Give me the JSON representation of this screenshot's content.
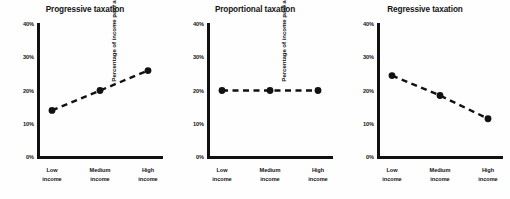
{
  "figure": {
    "background": "#fefefe",
    "ink": "#111111",
    "panel_count": 3
  },
  "chart_data": [
    {
      "type": "line",
      "title": "Progressive taxation",
      "xlabel": "",
      "ylabel": "Percentage of income paid as taxation",
      "categories": [
        "Low income",
        "Medium income",
        "High income"
      ],
      "category_lines": [
        [
          "Low",
          "income"
        ],
        [
          "Medium",
          "income"
        ],
        [
          "High",
          "income"
        ]
      ],
      "values": [
        14,
        20,
        26
      ],
      "ylim": [
        0,
        40
      ],
      "yticks": [
        0,
        10,
        20,
        30,
        40
      ],
      "ytick_labels": [
        "0%",
        "10%",
        "20%",
        "30%",
        "40%"
      ],
      "grid": false,
      "legend": "none",
      "line_style": "dashed",
      "marker": "circle",
      "series_color": "#111111"
    },
    {
      "type": "line",
      "title": "Proportional taxation",
      "xlabel": "",
      "ylabel": "Percentage of income paid as taxation",
      "categories": [
        "Low income",
        "Medium income",
        "High income"
      ],
      "category_lines": [
        [
          "Low",
          "income"
        ],
        [
          "Medium",
          "income"
        ],
        [
          "High",
          "income"
        ]
      ],
      "values": [
        20,
        20,
        20
      ],
      "ylim": [
        0,
        40
      ],
      "yticks": [
        0,
        10,
        20,
        30,
        40
      ],
      "ytick_labels": [
        "0%",
        "10%",
        "20%",
        "30%",
        "40%"
      ],
      "grid": false,
      "legend": "none",
      "line_style": "dashed",
      "marker": "circle",
      "series_color": "#111111"
    },
    {
      "type": "line",
      "title": "Regressive taxation",
      "xlabel": "",
      "ylabel": "Percentage of income paid as taxation",
      "categories": [
        "Low income",
        "Medium income",
        "High income"
      ],
      "category_lines": [
        [
          "Low",
          "income"
        ],
        [
          "Medium",
          "income"
        ],
        [
          "High",
          "income"
        ]
      ],
      "values": [
        24.5,
        18.5,
        11.5
      ],
      "ylim": [
        0,
        40
      ],
      "yticks": [
        0,
        10,
        20,
        30,
        40
      ],
      "ytick_labels": [
        "0%",
        "10%",
        "20%",
        "30%",
        "40%"
      ],
      "grid": false,
      "legend": "none",
      "line_style": "dashed",
      "marker": "circle",
      "series_color": "#111111"
    }
  ]
}
